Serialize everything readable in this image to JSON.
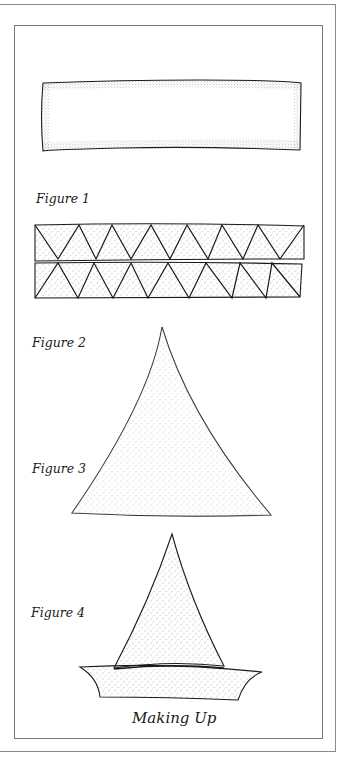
{
  "figures": {
    "figure1": {
      "label": "Figure 1"
    },
    "figure2": {
      "label": "Figure 2"
    },
    "figure3": {
      "label": "Figure 3"
    },
    "figure4": {
      "label": "Figure 4"
    }
  },
  "caption": "Making Up",
  "colors": {
    "ink": "#1a1a1a",
    "frame": "#7a7a7a",
    "stipple": "#555555"
  },
  "strip": {
    "top_row": {
      "top_vertices_x": [
        35,
        79,
        112,
        151,
        187,
        222,
        258,
        304
      ],
      "bottom_vertices_x": [
        58,
        96,
        131,
        170,
        208,
        243,
        280
      ]
    },
    "bottom_row": {
      "top_vertices_x": [
        58,
        94,
        131,
        168,
        206,
        240,
        272
      ],
      "bottom_vertices_x": [
        35,
        78,
        113,
        148,
        189,
        232,
        266,
        300
      ]
    }
  }
}
